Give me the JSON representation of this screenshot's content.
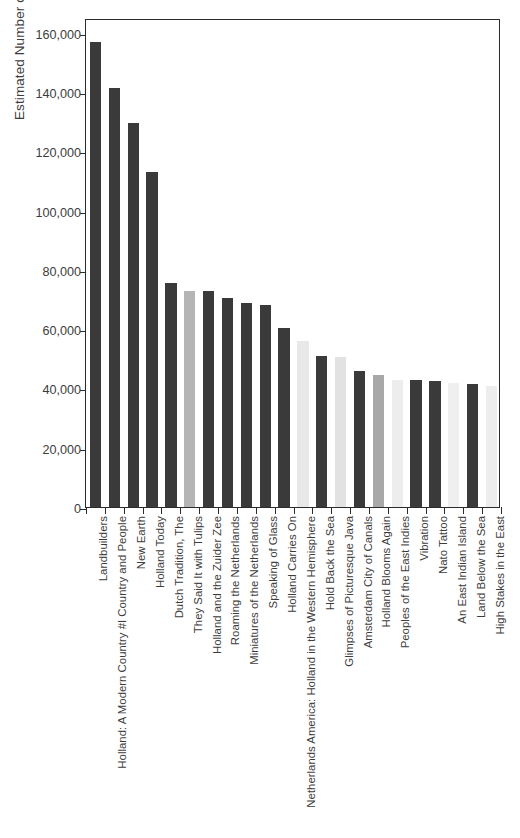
{
  "chart_data": {
    "type": "bar",
    "title": "",
    "xlabel": "",
    "ylabel": "Estimated Number of Viewers",
    "ylim": [
      0,
      165000
    ],
    "yticks": [
      0,
      20000,
      40000,
      60000,
      80000,
      100000,
      120000,
      140000,
      160000
    ],
    "ytick_labels": [
      "0",
      "20,000",
      "40,000",
      "60,000",
      "80,000",
      "100,000",
      "120,000",
      "140,000",
      "160,000"
    ],
    "grid": false,
    "legend": "none",
    "categories": [
      "Landbuilders",
      "Holland: A Modern Country #I Country and People",
      "New Earth",
      "Holland Today",
      "Dutch Tradition, The",
      "They Said It with Tulips",
      "Holland and the Zuider Zee",
      "Roaming the Netherlands",
      "Miniatures of the Netherlands",
      "Speaking of Glass",
      "Holland Carries On",
      "Netherlands America: Holland in the Western Hemisphere",
      "Hold Back the Sea",
      "Glimpses of Picturesque Java",
      "Amsterdam City of Canals",
      "Holland Blooms Again",
      "Peoples of the East Indies",
      "Vibration",
      "Nato Tattoo",
      "An East Indian Island",
      "Land Below the Sea",
      "High Stakes in the East"
    ],
    "values": [
      157000,
      141500,
      129500,
      113000,
      75500,
      73000,
      73000,
      70500,
      69000,
      68000,
      60500,
      56000,
      51000,
      50500,
      46000,
      44500,
      43000,
      43000,
      42500,
      42000,
      41500,
      41000
    ],
    "bar_colors": [
      "#3a3a3a",
      "#3a3a3a",
      "#3a3a3a",
      "#3a3a3a",
      "#3a3a3a",
      "#b5b5b5",
      "#3a3a3a",
      "#3a3a3a",
      "#3a3a3a",
      "#3a3a3a",
      "#3a3a3a",
      "#e8e8e8",
      "#3a3a3a",
      "#e2e2e2",
      "#3a3a3a",
      "#a8a8a8",
      "#ededed",
      "#3a3a3a",
      "#3a3a3a",
      "#efefef",
      "#3a3a3a",
      "#ededed"
    ]
  },
  "axes": {
    "y_axis_title": "Estimated Number of Viewers"
  }
}
